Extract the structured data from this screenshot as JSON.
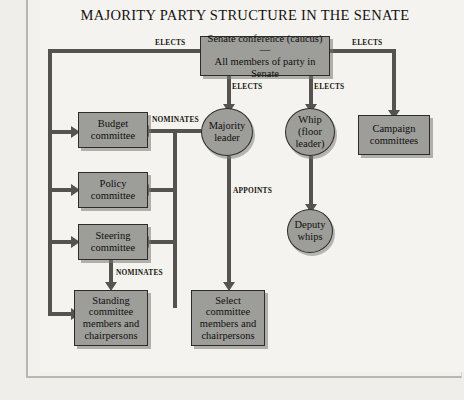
{
  "title": "MAJORITY PARTY STRUCTURE IN THE SENATE",
  "colors": {
    "node_fill": "#9d9d9a",
    "node_border": "#2d2c2a",
    "connector": "#55534f",
    "page_background": "#f4f3ef",
    "text": "#100f0e"
  },
  "nodes": {
    "caucus": {
      "line1": "Senate conference (caucus)—",
      "line2": "All members of party in Senate"
    },
    "majority_leader": {
      "line1": "Majority",
      "line2": "leader"
    },
    "whip": {
      "line1": "Whip",
      "line2": "(floor",
      "line3": "leader)"
    },
    "deputy_whips": {
      "line1": "Deputy",
      "line2": "whips"
    },
    "campaign_committees": {
      "line1": "Campaign",
      "line2": "committees"
    },
    "budget_committee": {
      "line1": "Budget",
      "line2": "committee"
    },
    "policy_committee": {
      "line1": "Policy",
      "line2": "committee"
    },
    "steering_committee": {
      "line1": "Steering",
      "line2": "committee"
    },
    "standing_members": {
      "line1": "Standing",
      "line2": "committee",
      "line3": "members and",
      "line4": "chairpersons"
    },
    "select_members": {
      "line1": "Select",
      "line2": "committee",
      "line3": "members and",
      "line4": "chairpersons"
    }
  },
  "edge_labels": {
    "elects_left": "ELECTS",
    "elects_right": "ELECTS",
    "elects_majority": "ELECTS",
    "elects_whip": "ELECTS",
    "nominates_leader": "NOMINATES",
    "nominates_steering": "NOMINATES",
    "appoints": "APPOINTS"
  }
}
